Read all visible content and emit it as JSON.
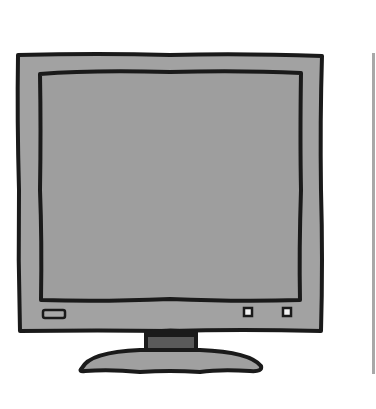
{
  "illustration": {
    "subject": "computer monitor",
    "colors": {
      "outline": "#1a1a1a",
      "bezel": "#a2a2a2",
      "screen": "#9e9e9e",
      "neck_inner": "#5a5a5a",
      "base": "#a0a0a0",
      "button_fill": "#f2f2f2",
      "divider": "#a8a8a8",
      "background": "#ffffff"
    },
    "parts": [
      "bezel",
      "screen",
      "power-button",
      "control-button-1",
      "control-button-2",
      "stand-neck",
      "stand-base"
    ]
  }
}
